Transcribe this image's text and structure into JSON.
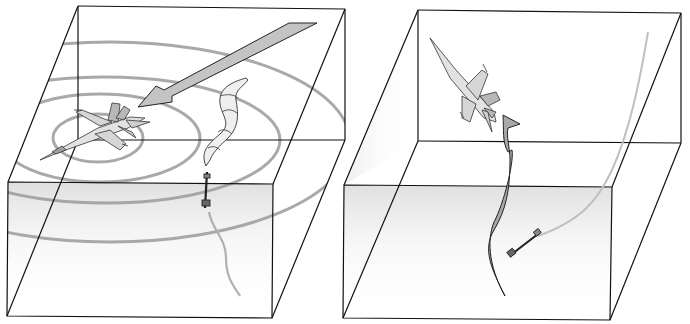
{
  "figure": {
    "panels": [
      {
        "id": "left",
        "description": "Aircraft inside radar rings with incoming guided missile trail and large threat arrow",
        "elements": [
          "box",
          "radar-rings",
          "aircraft-level",
          "threat-arrow",
          "decoy-plume",
          "missile",
          "missile-trail"
        ]
      },
      {
        "id": "right",
        "description": "Aircraft pitching up and breaking away from missile; curved evasive maneuver arrow",
        "elements": [
          "box",
          "aircraft-climbing",
          "evasion-arrow",
          "missile",
          "missile-trail"
        ]
      }
    ],
    "colors": {
      "edge": "#111111",
      "ring": "#9a9a9a",
      "arrow_fill": "#c4c4c4",
      "evasion_fill": "#a8a8a8",
      "shade": "#e6e6e6",
      "aircraft_fill": "#dcdcdc"
    }
  }
}
